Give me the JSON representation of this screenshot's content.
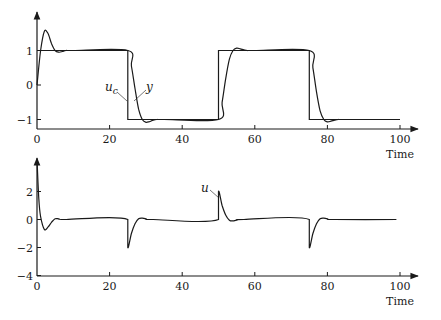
{
  "chart_data": [
    {
      "type": "line",
      "title": "",
      "xlabel": "Time",
      "ylabel": "",
      "xlim": [
        0,
        100
      ],
      "ylim": [
        -1.25,
        1.9
      ],
      "xticks": [
        0,
        20,
        40,
        60,
        80,
        100
      ],
      "xtick_labels": [
        "0",
        "20",
        "40",
        "60",
        "80",
        "100"
      ],
      "yticks": [
        -1,
        0,
        1
      ],
      "ytick_labels": [
        "−1",
        "0",
        "1"
      ],
      "grid": false,
      "legend": "none",
      "annotations": [
        {
          "text": "u_c",
          "display": "u",
          "sub": "c",
          "x": 22,
          "y": -0.4,
          "points_to": "reference step at t=25"
        },
        {
          "text": "y",
          "display": "y",
          "x": 34,
          "y": -0.2,
          "points_to": "output curve at t≈27"
        }
      ],
      "series": [
        {
          "name": "u_c",
          "style": "step",
          "x": [
            0,
            25,
            25,
            50,
            50,
            75,
            75,
            100
          ],
          "y": [
            1,
            1,
            -1,
            -1,
            1,
            1,
            -1,
            -1
          ]
        },
        {
          "name": "y",
          "style": "smooth",
          "x": [
            0,
            1,
            2,
            3,
            4,
            5,
            6,
            7,
            8,
            10,
            25,
            26,
            27,
            28,
            29,
            30,
            31,
            32,
            33,
            35,
            50,
            51,
            52,
            53,
            54,
            55,
            56,
            57,
            58,
            60,
            75,
            76,
            77,
            78,
            79,
            80,
            81,
            82,
            83,
            85,
            99
          ],
          "y": [
            0,
            1.0,
            1.55,
            1.5,
            1.2,
            1.0,
            0.95,
            0.97,
            1.0,
            1.0,
            1.0,
            0.55,
            -0.1,
            -0.7,
            -1.0,
            -1.08,
            -1.06,
            -1.02,
            -1.0,
            -1.0,
            -1.0,
            -0.5,
            0.2,
            0.75,
            1.0,
            1.07,
            1.05,
            1.02,
            1.0,
            1.0,
            1.0,
            0.5,
            -0.2,
            -0.75,
            -1.0,
            -1.07,
            -1.05,
            -1.02,
            -1.0,
            -1.0,
            -1.0
          ]
        }
      ]
    },
    {
      "type": "line",
      "title": "",
      "xlabel": "Time",
      "ylabel": "",
      "xlim": [
        0,
        100
      ],
      "ylim": [
        -4,
        4.3
      ],
      "xticks": [
        0,
        20,
        40,
        60,
        80,
        100
      ],
      "xtick_labels": [
        "0",
        "20",
        "40",
        "60",
        "80",
        "100"
      ],
      "yticks": [
        -4,
        -2,
        0,
        2
      ],
      "ytick_labels": [
        "−4",
        "−2",
        "0",
        "2"
      ],
      "grid": false,
      "legend": "none",
      "annotations": [
        {
          "text": "u",
          "display": "u",
          "x": 47,
          "y": 2.6,
          "points_to": "control spike at t=50"
        }
      ],
      "series": [
        {
          "name": "u",
          "style": "smooth",
          "x": [
            0,
            0.5,
            1,
            2,
            3,
            4,
            5,
            6,
            8,
            25,
            25.01,
            26,
            27,
            28,
            29,
            30,
            32,
            50,
            50.01,
            51,
            52,
            53,
            54,
            55,
            57,
            75,
            75.01,
            76,
            77,
            78,
            79,
            80,
            82,
            99
          ],
          "y": [
            4.3,
            1.5,
            0.2,
            -0.7,
            -0.55,
            -0.2,
            0.05,
            0.05,
            0.0,
            0.0,
            -2.0,
            -1.0,
            -0.3,
            0.05,
            0.1,
            0.05,
            0.0,
            0.0,
            2.0,
            1.0,
            0.3,
            -0.05,
            -0.1,
            -0.05,
            0.0,
            0.0,
            -2.0,
            -1.0,
            -0.3,
            0.05,
            0.1,
            0.05,
            0.0,
            0.0
          ]
        }
      ]
    }
  ],
  "panels": {
    "top": {
      "xlabel": "Time",
      "label_uc_main": "u",
      "label_uc_sub": "c",
      "label_y": "y"
    },
    "bottom": {
      "xlabel": "Time",
      "label_u": "u"
    }
  }
}
